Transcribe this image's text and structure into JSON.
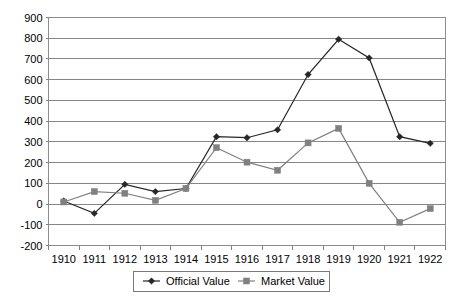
{
  "chart_data": {
    "type": "line",
    "title": "",
    "subtitle": "",
    "xlabel": "",
    "ylabel": "",
    "categories": [
      "1910",
      "1911",
      "1912",
      "1913",
      "1914",
      "1915",
      "1916",
      "1917",
      "1918",
      "1919",
      "1920",
      "1921",
      "1922"
    ],
    "ylim": [
      -200,
      900
    ],
    "ytick_values": [
      900,
      800,
      700,
      600,
      500,
      400,
      300,
      200,
      100,
      0,
      -100,
      -200
    ],
    "ytick_labels": [
      "900",
      "800",
      "700",
      "600",
      "500",
      "400",
      "300",
      "200",
      "100",
      "0",
      "-100",
      "-200"
    ],
    "grid": {
      "horizontal": true,
      "vertical": false
    },
    "legend": {
      "position": "bottom",
      "bordered": true
    },
    "series": [
      {
        "name": "Official Value",
        "color": "#262626",
        "marker": "diamond",
        "values": [
          15,
          -45,
          95,
          60,
          75,
          325,
          320,
          358,
          625,
          795,
          705,
          325,
          293
        ]
      },
      {
        "name": "Market Value",
        "color": "#808080",
        "marker": "square",
        "values": [
          10,
          60,
          52,
          18,
          75,
          272,
          202,
          163,
          295,
          365,
          100,
          -88,
          -22
        ]
      }
    ]
  },
  "legend": {
    "items": [
      {
        "label": "Official Value"
      },
      {
        "label": "Market Value"
      }
    ]
  }
}
